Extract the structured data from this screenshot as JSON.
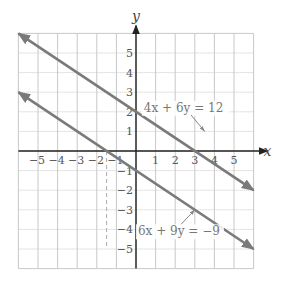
{
  "chart_data": {
    "type": "line",
    "title": "",
    "xlabel": "x",
    "ylabel": "y",
    "xlim": [
      -6,
      6
    ],
    "ylim": [
      -6,
      6
    ],
    "grid": true,
    "x_ticks": [
      -5,
      -4,
      -3,
      -2,
      -1,
      1,
      2,
      3,
      4,
      5
    ],
    "y_ticks": [
      -5,
      -4,
      -3,
      -2,
      -1,
      1,
      2,
      3,
      4,
      5
    ],
    "x_tick_labels": [
      "−5",
      "−4",
      "−3",
      "−2",
      "−1",
      "1",
      "2",
      "3",
      "4",
      "5"
    ],
    "y_tick_labels": [
      "−5",
      "−4",
      "−3",
      "−2",
      "−1",
      "1",
      "2",
      "3",
      "4",
      "5"
    ],
    "series": [
      {
        "name": "4x + 6y = 12",
        "equation": "4x + 6y = 12",
        "slope": -0.6667,
        "y_intercept": 2,
        "x_intercept": 3,
        "x": [
          -6,
          6
        ],
        "y": [
          6,
          -2
        ],
        "label_point": [
          3.5,
          1.0
        ],
        "label_pos": [
          0.4,
          2.0
        ],
        "color": "#7a7a7a"
      },
      {
        "name": "6x + 9y = −9",
        "equation": "6x + 9y = −9",
        "slope": -0.6667,
        "y_intercept": -1,
        "x_intercept": -1.5,
        "x": [
          -6,
          6
        ],
        "y": [
          3,
          -5
        ],
        "label_point": [
          3.0,
          -3.0
        ],
        "label_pos": [
          0.1,
          -4.3
        ],
        "color": "#7a7a7a"
      }
    ],
    "annotations": [
      "4x + 6y = 12",
      "6x + 9y = −9"
    ],
    "legend": "none (inline labels with leader arrows)"
  },
  "colors": {
    "grid": "#c8c8c8",
    "axis": "#222222",
    "line": "#7a7a7a",
    "text": "#555555"
  }
}
